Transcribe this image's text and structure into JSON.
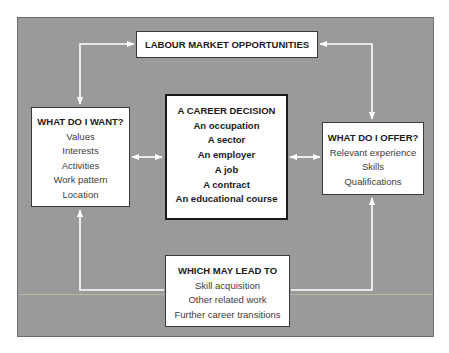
{
  "diagram": {
    "colors": {
      "panel_background": "#9a9a9a",
      "box_background": "#ffffff",
      "connector": "#ffffff",
      "text": "#1a1a1a"
    },
    "labour_market": {
      "title": "LABOUR MARKET OPPORTUNITIES"
    },
    "what_i_want": {
      "title": "WHAT DO I WANT?",
      "items": [
        "Values",
        "Interests",
        "Activities",
        "Work pattern",
        "Location"
      ]
    },
    "career_decision": {
      "title": "A CAREER DECISION",
      "items": [
        "An occupation",
        "A sector",
        "An employer",
        "A job",
        "A contract",
        "An educational course"
      ]
    },
    "what_i_offer": {
      "title": "WHAT DO I OFFER?",
      "items": [
        "Relevant experience",
        "Skills",
        "Qualifications"
      ]
    },
    "which_may_lead_to": {
      "title": "WHICH MAY LEAD TO",
      "items": [
        "Skill acquisition",
        "Other related work",
        "Further career transitions"
      ]
    },
    "connectors": [
      {
        "from": "what_i_want",
        "to": "labour_market",
        "type": "arrow-to-labour-market"
      },
      {
        "from": "labour_market",
        "to": "what_i_want",
        "type": "arrow-to-what-i-want"
      },
      {
        "from": "what_i_offer",
        "to": "labour_market",
        "type": "arrow-to-labour-market"
      },
      {
        "from": "labour_market",
        "to": "what_i_offer",
        "type": "arrow-to-what-i-offer"
      },
      {
        "from": "what_i_want",
        "to": "career_decision",
        "type": "double-headed"
      },
      {
        "from": "career_decision",
        "to": "what_i_offer",
        "type": "double-headed"
      },
      {
        "from": "which_may_lead_to",
        "to": "what_i_want",
        "type": "arrow"
      },
      {
        "from": "which_may_lead_to",
        "to": "what_i_offer",
        "type": "arrow"
      }
    ]
  }
}
